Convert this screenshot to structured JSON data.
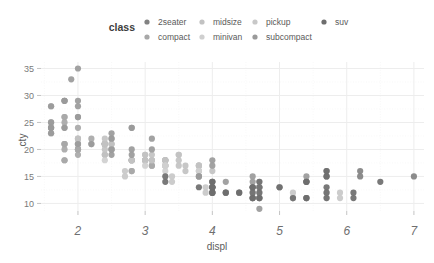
{
  "legend": {
    "title": "class",
    "items": [
      {
        "label": "2seater",
        "color": "#828282",
        "marker": "legend-dot"
      },
      {
        "label": "compact",
        "color": "#a8a8a8",
        "marker": "legend-dot"
      },
      {
        "label": "midsize",
        "color": "#c2c2c2",
        "marker": "legend-dot"
      },
      {
        "label": "minivan",
        "color": "#cfcfcf",
        "marker": "legend-dot"
      },
      {
        "label": "pickup",
        "color": "#c8c8c8",
        "marker": "legend-dot"
      },
      {
        "label": "subcompact",
        "color": "#9a9a9a",
        "marker": "legend-dot"
      },
      {
        "label": "suv",
        "color": "#6e6e6e",
        "marker": "legend-dot"
      }
    ]
  },
  "chart_data": {
    "type": "scatter",
    "title": "",
    "xlabel": "displ",
    "ylabel": "cty",
    "xlim": [
      1.45,
      7.15
    ],
    "ylim": [
      8.6,
      36.2
    ],
    "xticks": [
      2,
      3,
      4,
      5,
      6,
      7
    ],
    "yticks": [
      10,
      15,
      20,
      25,
      30,
      35
    ],
    "x_minor_ticks": [
      1.5,
      2.5,
      3.5,
      4.5,
      5.5,
      6.5
    ],
    "y_minor_ticks": [
      12.5,
      17.5,
      22.5,
      27.5,
      32.5
    ],
    "grid": true,
    "legend_position": "top",
    "legend_title": "class",
    "point_size": 3.1,
    "point_opacity": 0.92,
    "background": "#ffffff",
    "grid_major_color": "#ededed",
    "grid_minor_color": "#f5f5f5",
    "series": [
      {
        "name": "2seater",
        "color": "#828282",
        "points": [
          [
            5.7,
            16
          ],
          [
            5.7,
            15
          ],
          [
            6.2,
            16
          ],
          [
            6.2,
            15
          ],
          [
            7.0,
            15
          ]
        ]
      },
      {
        "name": "compact",
        "color": "#a8a8a8",
        "points": [
          [
            1.8,
            18
          ],
          [
            1.8,
            21
          ],
          [
            2.0,
            20
          ],
          [
            2.0,
            21
          ],
          [
            2.8,
            16
          ],
          [
            2.8,
            18
          ],
          [
            3.1,
            18
          ],
          [
            1.8,
            18
          ],
          [
            1.8,
            20
          ],
          [
            2.0,
            20
          ],
          [
            2.0,
            19
          ],
          [
            2.8,
            16
          ],
          [
            2.8,
            18
          ],
          [
            3.1,
            17
          ],
          [
            3.1,
            17
          ],
          [
            2.4,
            21
          ],
          [
            2.4,
            21
          ],
          [
            2.5,
            21
          ],
          [
            2.5,
            22
          ],
          [
            3.3,
            18
          ],
          [
            2.0,
            21
          ],
          [
            2.0,
            22
          ],
          [
            2.0,
            20
          ],
          [
            2.0,
            20
          ],
          [
            2.8,
            18
          ],
          [
            1.6,
            28
          ],
          [
            1.6,
            24
          ],
          [
            1.6,
            25
          ],
          [
            1.6,
            23
          ],
          [
            1.6,
            24
          ],
          [
            1.8,
            26
          ],
          [
            1.8,
            25
          ],
          [
            2.0,
            24
          ],
          [
            2.4,
            21
          ],
          [
            2.4,
            19
          ],
          [
            2.5,
            20
          ],
          [
            2.5,
            20
          ],
          [
            2.2,
            21
          ],
          [
            2.2,
            22
          ],
          [
            2.4,
            21
          ],
          [
            2.4,
            21
          ],
          [
            3.0,
            18
          ],
          [
            3.0,
            18
          ],
          [
            3.3,
            18
          ],
          [
            1.8,
            26
          ],
          [
            1.8,
            24
          ],
          [
            1.8,
            21
          ],
          [
            1.8,
            21
          ],
          [
            2.0,
            21
          ]
        ]
      },
      {
        "name": "midsize",
        "color": "#c2c2c2",
        "points": [
          [
            2.4,
            21
          ],
          [
            3.0,
            19
          ],
          [
            3.0,
            18
          ],
          [
            3.5,
            19
          ],
          [
            2.4,
            21
          ],
          [
            2.4,
            21
          ],
          [
            3.1,
            18
          ],
          [
            3.5,
            17
          ],
          [
            3.6,
            16
          ],
          [
            2.4,
            22
          ],
          [
            3.0,
            19
          ],
          [
            3.3,
            18
          ],
          [
            3.3,
            17
          ],
          [
            3.8,
            17
          ],
          [
            3.8,
            16
          ],
          [
            3.8,
            17
          ],
          [
            2.5,
            21
          ],
          [
            2.5,
            20
          ],
          [
            3.5,
            19
          ],
          [
            3.5,
            18
          ],
          [
            2.4,
            21
          ],
          [
            2.4,
            21
          ],
          [
            3.1,
            18
          ],
          [
            3.1,
            19
          ],
          [
            2.0,
            21
          ],
          [
            2.0,
            22
          ],
          [
            2.8,
            18
          ],
          [
            2.8,
            18
          ],
          [
            3.6,
            17
          ],
          [
            2.4,
            20
          ],
          [
            2.4,
            19
          ],
          [
            3.0,
            18
          ],
          [
            3.3,
            17
          ],
          [
            3.3,
            17
          ],
          [
            3.3,
            18
          ],
          [
            3.3,
            18
          ],
          [
            3.8,
            17
          ],
          [
            3.8,
            17
          ],
          [
            4.0,
            16
          ]
        ]
      },
      {
        "name": "minivan",
        "color": "#cfcfcf",
        "points": [
          [
            2.4,
            18
          ],
          [
            3.0,
            17
          ],
          [
            3.3,
            16
          ],
          [
            3.3,
            17
          ],
          [
            3.8,
            15
          ],
          [
            3.8,
            16
          ],
          [
            4.0,
            14
          ],
          [
            3.3,
            17
          ],
          [
            3.3,
            17
          ],
          [
            3.8,
            15
          ],
          [
            3.8,
            16
          ]
        ]
      },
      {
        "name": "pickup",
        "color": "#c8c8c8",
        "points": [
          [
            2.7,
            16
          ],
          [
            2.7,
            15
          ],
          [
            3.4,
            15
          ],
          [
            3.4,
            14
          ],
          [
            4.0,
            13
          ],
          [
            4.0,
            14
          ],
          [
            4.7,
            13
          ],
          [
            4.7,
            13
          ],
          [
            4.7,
            13
          ],
          [
            5.2,
            11
          ],
          [
            5.2,
            11
          ],
          [
            3.9,
            13
          ],
          [
            3.9,
            12
          ],
          [
            4.7,
            12
          ],
          [
            4.7,
            11
          ],
          [
            4.7,
            11
          ],
          [
            5.2,
            11
          ],
          [
            5.7,
            12
          ],
          [
            5.9,
            12
          ],
          [
            4.7,
            14
          ],
          [
            4.7,
            13
          ],
          [
            4.7,
            13
          ],
          [
            5.2,
            12
          ],
          [
            5.2,
            11
          ],
          [
            5.7,
            11
          ],
          [
            5.9,
            11
          ],
          [
            4.6,
            12
          ],
          [
            5.4,
            11
          ],
          [
            5.4,
            11
          ],
          [
            4.0,
            12
          ],
          [
            4.0,
            12
          ],
          [
            4.6,
            13
          ],
          [
            5.0,
            13
          ],
          [
            4.2,
            12
          ]
        ]
      },
      {
        "name": "subcompact",
        "color": "#9a9a9a",
        "points": [
          [
            1.8,
            29
          ],
          [
            1.8,
            29
          ],
          [
            2.0,
            26
          ],
          [
            2.0,
            29
          ],
          [
            2.8,
            24
          ],
          [
            2.8,
            24
          ],
          [
            3.1,
            22
          ],
          [
            1.8,
            29
          ],
          [
            1.8,
            24
          ],
          [
            2.0,
            26
          ],
          [
            2.0,
            28
          ],
          [
            2.8,
            20
          ],
          [
            2.8,
            19
          ],
          [
            3.1,
            20
          ],
          [
            1.6,
            28
          ],
          [
            1.6,
            24
          ],
          [
            1.6,
            25
          ],
          [
            1.6,
            23
          ],
          [
            1.6,
            24
          ],
          [
            2.5,
            23
          ],
          [
            2.5,
            22
          ],
          [
            5.4,
            15
          ],
          [
            5.4,
            14
          ],
          [
            4.0,
            18
          ],
          [
            4.0,
            17
          ],
          [
            4.6,
            15
          ],
          [
            5.0,
            13
          ],
          [
            4.2,
            14
          ],
          [
            4.6,
            14
          ],
          [
            4.6,
            13
          ],
          [
            5.4,
            14
          ],
          [
            3.8,
            15
          ],
          [
            3.8,
            15
          ],
          [
            4.7,
            9
          ],
          [
            1.9,
            33
          ],
          [
            2.0,
            35
          ],
          [
            2.0,
            21
          ],
          [
            2.5,
            19
          ],
          [
            2.5,
            20
          ],
          [
            2.2,
            21
          ]
        ]
      },
      {
        "name": "suv",
        "color": "#6e6e6e",
        "points": [
          [
            4.0,
            14
          ],
          [
            4.0,
            13
          ],
          [
            4.0,
            14
          ],
          [
            4.0,
            13
          ],
          [
            4.6,
            13
          ],
          [
            5.0,
            13
          ],
          [
            4.2,
            12
          ],
          [
            4.4,
            12
          ],
          [
            4.6,
            11
          ],
          [
            5.4,
            11
          ],
          [
            5.4,
            11
          ],
          [
            4.0,
            12
          ],
          [
            4.0,
            13
          ],
          [
            4.6,
            13
          ],
          [
            4.6,
            11
          ],
          [
            4.6,
            11
          ],
          [
            5.4,
            14
          ],
          [
            5.4,
            14
          ],
          [
            4.7,
            14
          ],
          [
            4.7,
            13
          ],
          [
            4.7,
            12
          ],
          [
            5.7,
            13
          ],
          [
            6.1,
            12
          ],
          [
            4.0,
            12
          ],
          [
            4.2,
            12
          ],
          [
            4.4,
            12
          ],
          [
            4.6,
            12
          ],
          [
            5.7,
            11
          ],
          [
            5.7,
            12
          ],
          [
            6.5,
            14
          ],
          [
            3.3,
            14
          ],
          [
            3.8,
            13
          ],
          [
            4.0,
            12
          ],
          [
            4.0,
            13
          ],
          [
            4.7,
            11
          ],
          [
            5.7,
            15
          ],
          [
            6.1,
            11
          ],
          [
            3.3,
            15
          ],
          [
            4.7,
            11
          ],
          [
            5.2,
            11
          ],
          [
            5.7,
            16
          ]
        ]
      }
    ]
  }
}
